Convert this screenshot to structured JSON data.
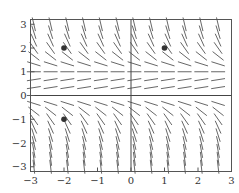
{
  "chart_data": {
    "type": "slope_field",
    "title": "",
    "equation_inferred": "dy/dx = y(1 - y)",
    "xlabel": "",
    "ylabel": "",
    "xlim": [
      -3,
      3
    ],
    "ylim": [
      -3.2,
      3.2
    ],
    "x_ticks": [
      -3,
      -2,
      -1,
      0,
      1,
      2,
      3
    ],
    "y_ticks": [
      -3,
      -2,
      -1,
      0,
      1,
      2,
      3
    ],
    "x_tick_labels": [
      "−3",
      "−2",
      "−1",
      "0",
      "1",
      "2",
      "3"
    ],
    "y_tick_labels": [
      "−3",
      "−2",
      "−1",
      "0",
      "1",
      "2",
      "3"
    ],
    "grid": false,
    "axes_lines_at_zero": true,
    "field": {
      "x_start": -2.9,
      "x_step": 0.5,
      "x_count": 12,
      "y_start": -3.0,
      "y_step": 0.3333,
      "y_count": 19,
      "segment_length_px": 14
    },
    "points": [
      {
        "x": -2,
        "y": 2
      },
      {
        "x": 1,
        "y": 2
      },
      {
        "x": -2,
        "y": -1
      }
    ],
    "colors": {
      "segment": "#555555",
      "point": "#333333",
      "axis": "#444444",
      "frame": "#555555"
    }
  }
}
